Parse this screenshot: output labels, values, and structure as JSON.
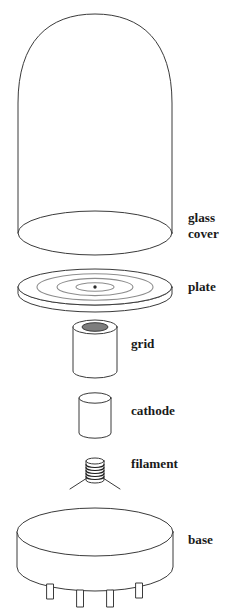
{
  "figure": {
    "background_color": "#ffffff",
    "outline_color": "#3a3a3a",
    "ring_color": "#8d8d8d",
    "label_color": "#1a1a1a"
  },
  "labels": {
    "glass_cover_line1": "glass",
    "glass_cover_line2": "cover",
    "plate": "plate",
    "grid": "grid",
    "cathode": "cathode",
    "filament": "filament",
    "base": "base"
  },
  "components": [
    {
      "name": "glass-cover",
      "label": "glass cover"
    },
    {
      "name": "plate",
      "label": "plate",
      "rings": 3,
      "has_center_dot": true
    },
    {
      "name": "grid",
      "label": "grid"
    },
    {
      "name": "cathode",
      "label": "cathode"
    },
    {
      "name": "filament",
      "label": "filament",
      "coil_turns": 6
    },
    {
      "name": "base",
      "label": "base",
      "pins": 4
    }
  ]
}
